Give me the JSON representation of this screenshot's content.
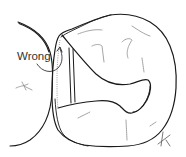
{
  "diagram": {
    "type": "dental-occlusal-line-drawing",
    "annotation_label": "Wrong",
    "colors": {
      "line": "#1a1a1a",
      "faint": "#8a8a8a",
      "background": "#ffffff",
      "text": "#333333"
    },
    "elements": [
      "adjacent-tooth-outline",
      "tooth-outline",
      "cavity-preparation-outline",
      "wall-double-line",
      "curved-arrow",
      "fissure-marks",
      "orientation-mark"
    ]
  }
}
